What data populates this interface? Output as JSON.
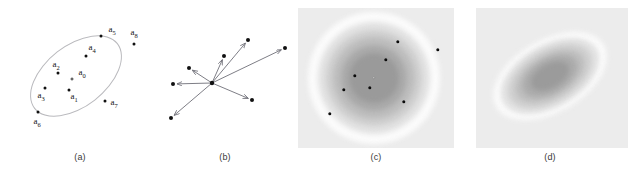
{
  "figure": {
    "panels": [
      {
        "id": "a",
        "caption": "(a)",
        "description": "scatter of labelled sample points with enclosing ellipse",
        "points": [
          {
            "label": "a",
            "sub": "5",
            "x": 101,
            "y": 36,
            "lx": 112,
            "ly": 30,
            "inside": false
          },
          {
            "label": "a",
            "sub": "8",
            "x": 134,
            "y": 44,
            "lx": 134,
            "ly": 33,
            "inside": false
          },
          {
            "label": "a",
            "sub": "4",
            "x": 86,
            "y": 56,
            "lx": 92,
            "ly": 48,
            "inside": true
          },
          {
            "label": "a",
            "sub": "2",
            "x": 58,
            "y": 73,
            "lx": 56,
            "ly": 65,
            "inside": true
          },
          {
            "label": "a",
            "sub": "0",
            "x": 72,
            "y": 79,
            "lx": 82,
            "ly": 73,
            "inside": true,
            "open": true
          },
          {
            "label": "a",
            "sub": "1",
            "x": 69,
            "y": 90,
            "lx": 74,
            "ly": 97,
            "inside": true
          },
          {
            "label": "a",
            "sub": "3",
            "x": 45,
            "y": 88,
            "lx": 41,
            "ly": 96,
            "inside": true
          },
          {
            "label": "a",
            "sub": "7",
            "x": 105,
            "y": 101,
            "lx": 114,
            "ly": 103,
            "inside": false
          },
          {
            "label": "a",
            "sub": "6",
            "x": 38,
            "y": 112,
            "lx": 37,
            "ly": 122,
            "inside": false
          }
        ],
        "ellipse": {
          "cx": 76,
          "cy": 76,
          "rx": 52,
          "ry": 30,
          "rotation_deg": -38
        }
      },
      {
        "id": "b",
        "caption": "(b)",
        "description": "difference vectors drawn from the mean point to each sample",
        "origin": {
          "x": 52,
          "y": 83
        },
        "vectors": [
          {
            "x": 88,
            "y": 40
          },
          {
            "x": 64,
            "y": 56
          },
          {
            "x": 125,
            "y": 48
          },
          {
            "x": 29,
            "y": 68
          },
          {
            "x": 13,
            "y": 84
          },
          {
            "x": 92,
            "y": 100
          },
          {
            "x": 11,
            "y": 118
          }
        ]
      },
      {
        "id": "c",
        "caption": "(c)",
        "description": "isotropic circular density contours with sample points",
        "field": {
          "x": 8,
          "y": 8,
          "w": 156,
          "h": 140,
          "background": "#ececec"
        },
        "center": {
          "x": 84,
          "y": 78
        },
        "rings": [
          {
            "radius": 66,
            "color": "#fbfbfb"
          },
          {
            "radius": 56,
            "color": "#e2e2e2"
          },
          {
            "radius": 48,
            "color": "#cfcfcf"
          },
          {
            "radius": 41,
            "color": "#bdbdbd"
          },
          {
            "radius": 33,
            "color": "#aaaaaa"
          },
          {
            "radius": 25,
            "color": "#9a9a9a"
          }
        ],
        "points": [
          {
            "x": 108,
            "y": 42
          },
          {
            "x": 148,
            "y": 50
          },
          {
            "x": 96,
            "y": 60
          },
          {
            "x": 65,
            "y": 76
          },
          {
            "x": 84,
            "y": 78,
            "open": true
          },
          {
            "x": 80,
            "y": 88
          },
          {
            "x": 54,
            "y": 90
          },
          {
            "x": 114,
            "y": 102
          },
          {
            "x": 40,
            "y": 114
          }
        ]
      },
      {
        "id": "d",
        "caption": "(d)",
        "description": "anisotropic tilted elliptical density contours",
        "field": {
          "x": 14,
          "y": 8,
          "w": 152,
          "h": 140,
          "background": "#ececec"
        },
        "center": {
          "x": 88,
          "y": 76
        },
        "rotation_deg": -30,
        "rings": [
          {
            "rx": 62,
            "ry": 36,
            "color": "#fbfbfb"
          },
          {
            "rx": 54,
            "ry": 31,
            "color": "#e2e2e2"
          },
          {
            "rx": 46,
            "ry": 26,
            "color": "#cfcfcf"
          },
          {
            "rx": 38,
            "ry": 21,
            "color": "#bdbdbd"
          },
          {
            "rx": 30,
            "ry": 17,
            "color": "#ababab"
          },
          {
            "rx": 21,
            "ry": 12,
            "color": "#9b9b9b"
          }
        ]
      }
    ]
  }
}
